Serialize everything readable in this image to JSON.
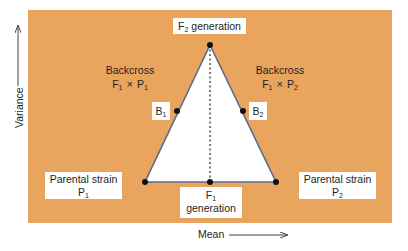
{
  "diagram": {
    "type": "triangle-genetics-variance-mean",
    "colors": {
      "background_panel": "#e9a45e",
      "triangle_fill": "#ffffff",
      "triangle_edge": "#5a6b8c",
      "dots": "#111111",
      "label_bg": "#ffffff",
      "text": "#231f20"
    },
    "axes": {
      "x_label": "Mean",
      "y_label": "Variance"
    },
    "nodes": {
      "f2": {
        "prefix": "F",
        "sub": "2",
        "suffix": " generation"
      },
      "f1": {
        "prefix": "F",
        "sub": "1",
        "line2": "generation"
      },
      "p1": {
        "line1": "Parental strain",
        "prefix": "P",
        "sub": "1"
      },
      "p2": {
        "line1": "Parental strain",
        "prefix": "P",
        "sub": "2"
      },
      "b1": {
        "prefix": "B",
        "sub": "1"
      },
      "b2": {
        "prefix": "B",
        "sub": "2"
      }
    },
    "backcross_left": {
      "title": "Backcross",
      "a_prefix": "F",
      "a_sub": "1",
      "cross": "×",
      "b_prefix": "P",
      "b_sub": "1"
    },
    "backcross_right": {
      "title": "Backcross",
      "a_prefix": "F",
      "a_sub": "1",
      "cross": "×",
      "b_prefix": "P",
      "b_sub": "2"
    }
  }
}
